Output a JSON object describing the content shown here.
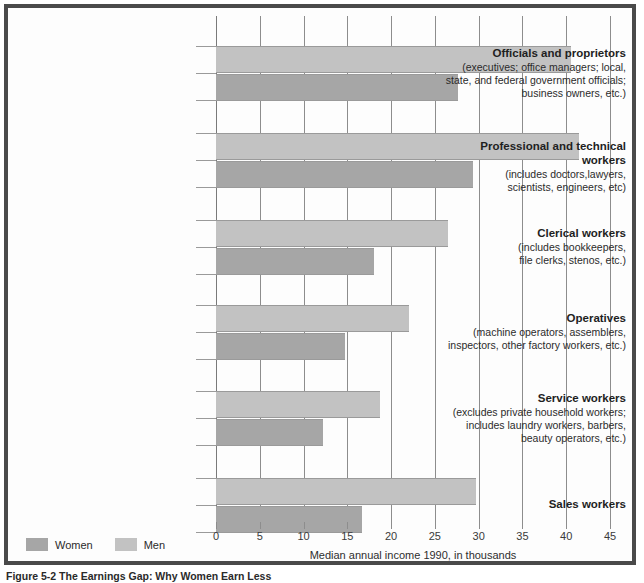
{
  "figure": {
    "caption": "Figure 5-2 The Earnings Gap: Why Women Earn Less"
  },
  "legend": {
    "items": [
      {
        "label": "Women",
        "color": "#a6a6a6"
      },
      {
        "label": "Men",
        "color": "#c2c2c2"
      }
    ]
  },
  "axis": {
    "title": "Median annual income 1990, in thousands",
    "ticks": [
      "0",
      "5",
      "10",
      "15",
      "20",
      "25",
      "30",
      "35",
      "40",
      "45"
    ]
  },
  "chart_data": {
    "type": "bar",
    "orientation": "horizontal",
    "title": "Figure 5-2 The Earnings Gap: Why Women Earn Less",
    "xlabel": "Median annual income 1990, in thousands",
    "ylabel": "",
    "xlim": [
      0,
      45
    ],
    "xticks": [
      0,
      5,
      10,
      15,
      20,
      25,
      30,
      35,
      40,
      45
    ],
    "grid": "vertical",
    "legend_position": "bottom-left",
    "categories": [
      "Officials and proprietors",
      "Professional and technical workers",
      "Clerical workers",
      "Operatives",
      "Service workers",
      "Sales workers"
    ],
    "category_descriptions": [
      "(executives; office managers; local, state, and federal government officials; business owners, etc.)",
      "(includes doctors,lawyers, scientists, engineers, etc)",
      "(includes bookkeepers, file clerks, stenos, etc.)",
      "(machine operators, assemblers, inspectors, other factory workers, etc.)",
      "(excludes private household workers; includes laundry workers, barbers, beauty operators, etc.)",
      ""
    ],
    "series": [
      {
        "name": "Men",
        "color": "#c2c2c2",
        "values": [
          40.6,
          41.5,
          26.5,
          22.0,
          18.7,
          29.7
        ]
      },
      {
        "name": "Women",
        "color": "#a6a6a6",
        "values": [
          27.6,
          29.3,
          18.1,
          14.7,
          12.2,
          16.7
        ]
      }
    ]
  },
  "groups": [
    {
      "title": "Officials and proprietors",
      "sub_lines": [
        "(executives; office managers; local,",
        "state, and federal government officials;",
        "business owners, etc.)"
      ],
      "men": 40.6,
      "women": 27.6
    },
    {
      "title": "Professional and technical workers",
      "sub_lines": [
        "(includes doctors,lawyers,",
        "scientists, engineers, etc)"
      ],
      "men": 41.5,
      "women": 29.3
    },
    {
      "title": "Clerical workers",
      "sub_lines": [
        "(includes bookkeepers,",
        "file clerks, stenos, etc.)"
      ],
      "men": 26.5,
      "women": 18.1
    },
    {
      "title": "Operatives",
      "sub_lines": [
        "(machine operators, assemblers,",
        "inspectors, other factory workers, etc.)"
      ],
      "men": 22.0,
      "women": 14.7
    },
    {
      "title": "Service workers",
      "sub_lines": [
        "(excludes private household workers;",
        "includes laundry workers, barbers,",
        "beauty operators, etc.)"
      ],
      "men": 18.7,
      "women": 12.2
    },
    {
      "title": "Sales workers",
      "sub_lines": [],
      "men": 29.7,
      "women": 16.7
    }
  ]
}
